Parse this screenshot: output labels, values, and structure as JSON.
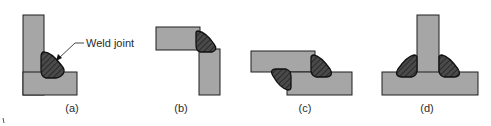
{
  "diagram": {
    "plate_color": "#a6a6a6",
    "plate_stroke": "#1e1e1e",
    "weld_color": "#3c3c3c",
    "callout_label": "Weld joint",
    "figures": [
      {
        "id": "a",
        "caption": "(a)",
        "joint": "corner / fillet weld on L-shaped assembly"
      },
      {
        "id": "b",
        "caption": "(b)",
        "joint": "outside corner weld"
      },
      {
        "id": "c",
        "caption": "(c)",
        "joint": "lap joint with two fillet welds"
      },
      {
        "id": "d",
        "caption": "(d)",
        "joint": "tee joint with double fillet weld"
      }
    ]
  }
}
